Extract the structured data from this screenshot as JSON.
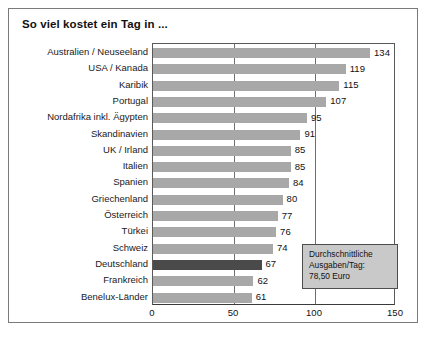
{
  "chart": {
    "title": "So viel kostet ein Tag in ...",
    "annotation": {
      "line1": "Durchschnittliche",
      "line2": "Ausgaben/Tag:",
      "line3": "78,50 Euro"
    }
  },
  "chart_data": {
    "type": "bar",
    "orientation": "horizontal",
    "title": "So viel kostet ein Tag in ...",
    "xlabel": "",
    "ylabel": "",
    "xlim": [
      0,
      150
    ],
    "xticks": [
      0,
      50,
      100,
      150
    ],
    "xtick_labels": [
      "0",
      "50",
      "100",
      "150"
    ],
    "grid": true,
    "legend": false,
    "categories": [
      "Australien / Neuseeland",
      "USA / Kanada",
      "Karibik",
      "Portugal",
      "Nordafrika inkl. Ägypten",
      "Skandinavien",
      "UK / Irland",
      "Italien",
      "Spanien",
      "Griechenland",
      "Österreich",
      "Türkei",
      "Schweiz",
      "Deutschland",
      "Frankreich",
      "Benelux-Länder"
    ],
    "values": [
      134,
      119,
      115,
      107,
      95,
      91,
      85,
      85,
      84,
      80,
      77,
      76,
      74,
      67,
      62,
      61
    ],
    "value_labels": [
      "134",
      "119",
      "115",
      "107",
      "95",
      "91",
      "85",
      "85",
      "84",
      "80",
      "77",
      "76",
      "74",
      "67",
      "62",
      "61"
    ],
    "highlight_category": "Deutschland",
    "colors": {
      "bar": "#a8a8a8",
      "bar_highlight": "#4a4a4a",
      "annotation_bg": "#c9c9c9",
      "axis": "#5a5a5a",
      "text": "#111111"
    },
    "annotations": [
      {
        "text": "Durchschnittliche Ausgaben/Tag: 78,50 Euro",
        "value": 78.5,
        "unit": "Euro"
      }
    ]
  }
}
